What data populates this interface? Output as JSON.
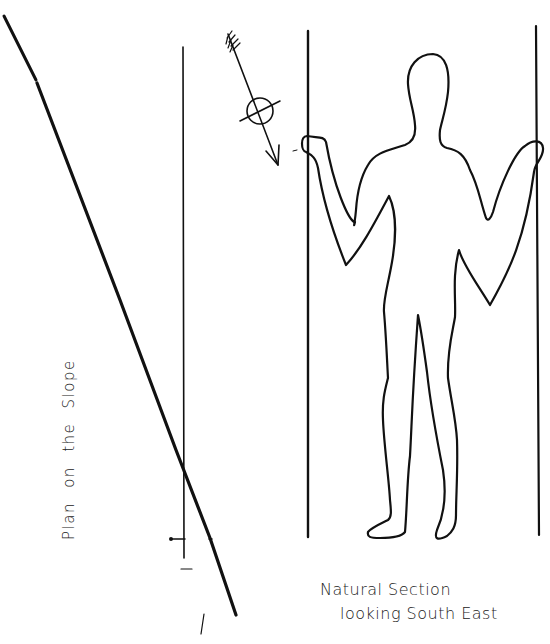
{
  "drawing": {
    "ink_color": "#111111",
    "background": "#ffffff",
    "slope_label": "Plan on the Slope",
    "caption": {
      "line1": "Natural Section",
      "line2": "looking South East"
    },
    "elements": {
      "slope_line": "diagonal ground line",
      "vertical_staff": "vertical reference line",
      "north_arrow": "arrow with circled cross (compass)",
      "figure": "outline of standing human holding two staffs",
      "left_staff": "vertical staff left of figure",
      "right_staff": "vertical staff right of figure"
    }
  }
}
